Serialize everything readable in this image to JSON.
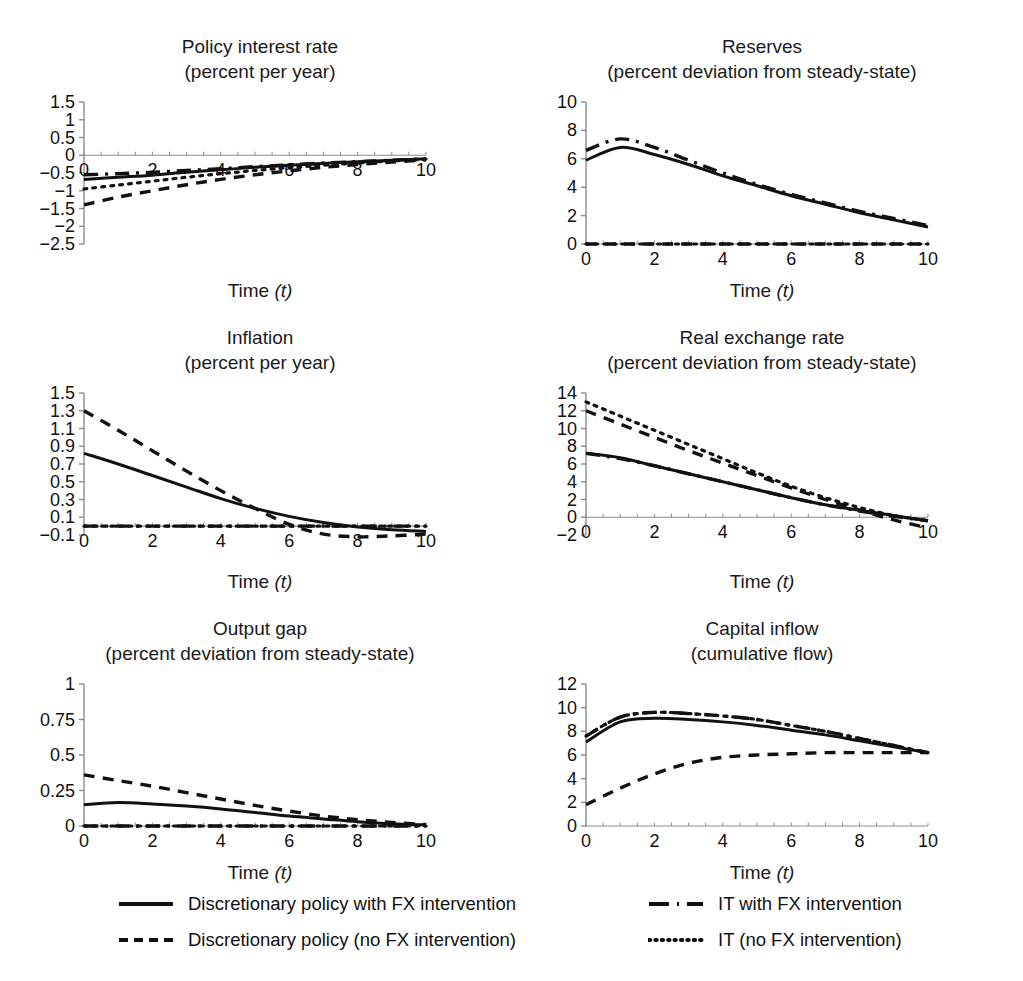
{
  "figure": {
    "axis_xlabel": "Time",
    "axis_xlabel_var": "(t)",
    "line_color": "#111111",
    "axis_color": "#8c8c8c"
  },
  "legend": {
    "items": [
      {
        "style": "solid",
        "label": "Discretionary policy with FX intervention"
      },
      {
        "style": "dashed",
        "label": "Discretionary policy (no FX intervention)"
      },
      {
        "style": "dashdot",
        "label": "IT with FX intervention"
      },
      {
        "style": "dotted",
        "label": "IT (no FX intervention)"
      }
    ]
  },
  "chart_data": [
    {
      "type": "line",
      "title": "Policy interest rate",
      "subtitle": "(percent per year)",
      "xlabel": "Time (t)",
      "ylabel": "",
      "xlim": [
        0,
        10
      ],
      "ylim": [
        -2.5,
        1.5
      ],
      "xticks": [
        0,
        2,
        4,
        6,
        8,
        10
      ],
      "yticks": [
        1.5,
        1,
        0.5,
        0,
        -0.5,
        -1,
        -1.5,
        -2,
        -2.5
      ],
      "ytick_labels": [
        "1.5",
        "1",
        "0.5",
        "0",
        "-0.5",
        "-1",
        "-1.5",
        "-2",
        "-2.5"
      ],
      "grid": false,
      "zero_line": 0,
      "x": [
        0,
        1,
        2,
        3,
        4,
        5,
        6,
        7,
        8,
        9,
        10
      ],
      "series": [
        {
          "name": "Discretionary policy with FX intervention",
          "style": "solid",
          "values": [
            -0.68,
            -0.62,
            -0.56,
            -0.48,
            -0.41,
            -0.34,
            -0.28,
            -0.23,
            -0.18,
            -0.14,
            -0.1
          ]
        },
        {
          "name": "Discretionary policy (no FX intervention)",
          "style": "dashed",
          "values": [
            -1.4,
            -1.18,
            -1.0,
            -0.83,
            -0.68,
            -0.55,
            -0.44,
            -0.34,
            -0.26,
            -0.19,
            -0.13
          ]
        },
        {
          "name": "IT with FX intervention",
          "style": "dashdot",
          "values": [
            -0.55,
            -0.52,
            -0.48,
            -0.43,
            -0.38,
            -0.32,
            -0.27,
            -0.22,
            -0.18,
            -0.14,
            -0.1
          ]
        },
        {
          "name": "IT (no FX intervention)",
          "style": "dotted",
          "values": [
            -0.95,
            -0.84,
            -0.73,
            -0.62,
            -0.52,
            -0.43,
            -0.35,
            -0.28,
            -0.22,
            -0.16,
            -0.11
          ]
        }
      ]
    },
    {
      "type": "line",
      "title": "Reserves",
      "subtitle": "(percent deviation from steady-state)",
      "xlabel": "Time (t)",
      "ylabel": "",
      "xlim": [
        0,
        10
      ],
      "ylim": [
        0,
        10
      ],
      "xticks": [
        0,
        2,
        4,
        6,
        8,
        10
      ],
      "yticks": [
        10,
        8,
        6,
        4,
        2,
        0
      ],
      "ytick_labels": [
        "10",
        "8",
        "6",
        "4",
        "2",
        "0"
      ],
      "grid": false,
      "zero_line": 0,
      "x": [
        0,
        1,
        2,
        3,
        4,
        5,
        6,
        7,
        8,
        9,
        10
      ],
      "series": [
        {
          "name": "Discretionary policy with FX intervention",
          "style": "solid",
          "values": [
            5.9,
            6.8,
            6.3,
            5.6,
            4.8,
            4.1,
            3.4,
            2.8,
            2.2,
            1.7,
            1.2
          ]
        },
        {
          "name": "Discretionary policy (no FX intervention)",
          "style": "dashed",
          "values": [
            0,
            0,
            0,
            0,
            0,
            0,
            0,
            0,
            0,
            0,
            0
          ]
        },
        {
          "name": "IT with FX intervention",
          "style": "dashdot",
          "values": [
            6.6,
            7.4,
            6.8,
            5.9,
            5.0,
            4.2,
            3.5,
            2.9,
            2.3,
            1.8,
            1.3
          ]
        },
        {
          "name": "IT (no FX intervention)",
          "style": "dotted",
          "values": [
            0,
            0,
            0,
            0,
            0,
            0,
            0,
            0,
            0,
            0,
            0
          ]
        }
      ]
    },
    {
      "type": "line",
      "title": "Inflation",
      "subtitle": "(percent per year)",
      "xlabel": "Time (t)",
      "ylabel": "",
      "xlim": [
        0,
        10
      ],
      "ylim": [
        -0.1,
        1.5
      ],
      "xticks": [
        0,
        2,
        4,
        6,
        8,
        10
      ],
      "yticks": [
        1.5,
        1.3,
        1.1,
        0.9,
        0.7,
        0.5,
        0.3,
        0.1,
        -0.1
      ],
      "ytick_labels": [
        "1.5",
        "1.3",
        "1.1",
        "0.9",
        "0.7",
        "0.5",
        "0.3",
        "0.1",
        "-0.1"
      ],
      "grid": false,
      "zero_line": 0,
      "x": [
        0,
        1,
        2,
        3,
        4,
        5,
        6,
        7,
        8,
        9,
        10
      ],
      "series": [
        {
          "name": "Discretionary policy with FX intervention",
          "style": "solid",
          "values": [
            0.82,
            0.7,
            0.57,
            0.44,
            0.31,
            0.2,
            0.11,
            0.04,
            -0.01,
            -0.04,
            -0.06
          ]
        },
        {
          "name": "Discretionary policy (no FX intervention)",
          "style": "dashed",
          "values": [
            1.3,
            1.08,
            0.85,
            0.62,
            0.4,
            0.2,
            0.02,
            -0.09,
            -0.12,
            -0.11,
            -0.09
          ]
        },
        {
          "name": "IT with FX intervention",
          "style": "dashdot",
          "values": [
            0,
            0,
            0,
            0,
            0,
            0,
            0,
            0,
            0,
            0,
            0
          ]
        },
        {
          "name": "IT (no FX intervention)",
          "style": "dotted",
          "values": [
            0,
            0,
            0,
            0,
            0,
            0,
            0,
            0,
            0,
            0,
            0
          ]
        }
      ]
    },
    {
      "type": "line",
      "title": "Real exchange rate",
      "subtitle": "(percent deviation from steady-state)",
      "xlabel": "Time (t)",
      "ylabel": "",
      "xlim": [
        0,
        10
      ],
      "ylim": [
        -2,
        14
      ],
      "xticks": [
        0,
        2,
        4,
        6,
        8,
        10
      ],
      "yticks": [
        14,
        12,
        10,
        8,
        6,
        4,
        2,
        0,
        -2
      ],
      "ytick_labels": [
        "14",
        "12",
        "10",
        "8",
        "6",
        "4",
        "2",
        "0",
        "-2"
      ],
      "grid": false,
      "zero_line": 0,
      "x": [
        0,
        1,
        2,
        3,
        4,
        5,
        6,
        7,
        8,
        9,
        10
      ],
      "series": [
        {
          "name": "Discretionary policy with FX intervention",
          "style": "solid",
          "values": [
            7.2,
            6.7,
            5.8,
            4.9,
            4.0,
            3.1,
            2.2,
            1.4,
            0.8,
            0.2,
            -0.4
          ]
        },
        {
          "name": "Discretionary policy (no FX intervention)",
          "style": "dashed",
          "values": [
            12.0,
            10.5,
            9.0,
            7.5,
            6.1,
            4.7,
            3.3,
            2.0,
            0.8,
            -0.3,
            -1.2
          ]
        },
        {
          "name": "IT with FX intervention",
          "style": "dashdot",
          "values": [
            7.2,
            6.6,
            5.8,
            4.9,
            4.0,
            3.1,
            2.2,
            1.4,
            0.7,
            0.1,
            -0.4
          ]
        },
        {
          "name": "IT (no FX intervention)",
          "style": "dotted",
          "values": [
            13.0,
            11.4,
            9.8,
            8.2,
            6.6,
            5.0,
            3.5,
            2.2,
            1.1,
            0.2,
            -0.4
          ]
        }
      ]
    },
    {
      "type": "line",
      "title": "Output gap",
      "subtitle": "(percent deviation from steady-state)",
      "xlabel": "Time (t)",
      "ylabel": "",
      "xlim": [
        0,
        10
      ],
      "ylim": [
        0,
        1
      ],
      "xticks": [
        0,
        2,
        4,
        6,
        8,
        10
      ],
      "yticks": [
        1,
        0.75,
        0.5,
        0.25,
        0
      ],
      "ytick_labels": [
        "1",
        "0.75",
        "0.5",
        "0.25",
        "0"
      ],
      "grid": false,
      "zero_line": 0,
      "x": [
        0,
        1,
        2,
        3,
        4,
        5,
        6,
        7,
        8,
        9,
        10
      ],
      "series": [
        {
          "name": "Discretionary policy with FX intervention",
          "style": "solid",
          "values": [
            0.15,
            0.165,
            0.155,
            0.14,
            0.12,
            0.095,
            0.07,
            0.05,
            0.03,
            0.015,
            0.008
          ]
        },
        {
          "name": "Discretionary policy (no FX intervention)",
          "style": "dashed",
          "values": [
            0.36,
            0.32,
            0.28,
            0.235,
            0.19,
            0.145,
            0.105,
            0.07,
            0.045,
            0.025,
            0.01
          ]
        },
        {
          "name": "IT with FX intervention",
          "style": "dashdot",
          "values": [
            0,
            0,
            0,
            0,
            0,
            0,
            0,
            0,
            0,
            0,
            0
          ]
        },
        {
          "name": "IT (no FX intervention)",
          "style": "dotted",
          "values": [
            0,
            0,
            0,
            0,
            0,
            0,
            0,
            0,
            0,
            0,
            0
          ]
        }
      ]
    },
    {
      "type": "line",
      "title": "Capital inflow",
      "subtitle": "(cumulative flow)",
      "xlabel": "Time (t)",
      "ylabel": "",
      "xlim": [
        0,
        10
      ],
      "ylim": [
        0,
        12
      ],
      "xticks": [
        0,
        2,
        4,
        6,
        8,
        10
      ],
      "yticks": [
        12,
        10,
        8,
        6,
        4,
        2,
        0
      ],
      "ytick_labels": [
        "12",
        "10",
        "8",
        "6",
        "4",
        "2",
        "0"
      ],
      "grid": false,
      "zero_line": 0,
      "x": [
        0,
        1,
        2,
        3,
        4,
        5,
        6,
        7,
        8,
        9,
        10
      ],
      "series": [
        {
          "name": "Discretionary policy with FX intervention",
          "style": "solid",
          "values": [
            7.1,
            8.8,
            9.1,
            9.0,
            8.8,
            8.5,
            8.1,
            7.7,
            7.2,
            6.7,
            6.2
          ]
        },
        {
          "name": "Discretionary policy (no FX intervention)",
          "style": "dashed",
          "values": [
            1.8,
            3.2,
            4.4,
            5.3,
            5.8,
            6.0,
            6.1,
            6.2,
            6.2,
            6.2,
            6.2
          ]
        },
        {
          "name": "IT with FX intervention",
          "style": "dashdot",
          "values": [
            7.6,
            9.2,
            9.6,
            9.5,
            9.3,
            9.0,
            8.5,
            8.0,
            7.4,
            6.8,
            6.2
          ]
        },
        {
          "name": "IT (no FX intervention)",
          "style": "dotted",
          "values": [
            7.6,
            9.2,
            9.6,
            9.5,
            9.3,
            9.0,
            8.5,
            8.0,
            7.4,
            6.8,
            6.2
          ]
        }
      ]
    }
  ]
}
